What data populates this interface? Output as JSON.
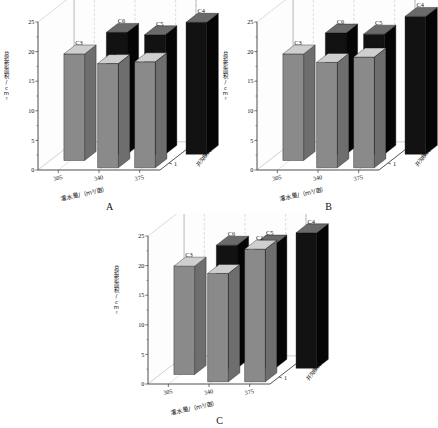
{
  "figure": {
    "background": "#ffffff",
    "panels": [
      "A",
      "B",
      "C"
    ]
  },
  "axis": {
    "ylabel": "总投影面积/cm²",
    "xlabel": "灌水量/（m³/亩）",
    "zlabel": "开沟模式",
    "yticks": [
      "0",
      "5",
      "10",
      "15",
      "20",
      "25"
    ],
    "xticks": [
      "305",
      "340",
      "375"
    ],
    "zticks": [
      "1",
      "2"
    ],
    "ylim": [
      0,
      25
    ]
  },
  "colors": {
    "bar_gray": "#8a8a8a",
    "bar_gray_side": "#6e6e6e",
    "bar_gray_top": "#cfcfcf",
    "bar_black": "#121212",
    "bar_black_side": "#050505",
    "bar_black_top": "#6a6a6a",
    "wall": "#fdfdfd",
    "floor": "#ffffff",
    "grid": "#b9b9b9",
    "axis_line": "#3a3a3a"
  },
  "chart_data": [
    {
      "type": "bar",
      "title": "A",
      "xlabel": "灌水量/（m³/亩）",
      "ylabel": "总投影面积/cm²",
      "zlabel": "开沟模式",
      "categories": [
        "305",
        "340",
        "375"
      ],
      "z_categories": [
        "1",
        "2"
      ],
      "ylim": [
        0,
        25
      ],
      "grid": true,
      "legend": "none",
      "bars": [
        {
          "label": "C3",
          "x": "305",
          "z": "1",
          "value": 18.0,
          "color": "gray"
        },
        {
          "label": "C6",
          "x": "340",
          "z": "1",
          "value": 20.6,
          "color": "black"
        },
        {
          "label": "C2",
          "x": "340",
          "z": "2",
          "value": 17.6,
          "color": "gray"
        },
        {
          "label": "C5",
          "x": "375",
          "z": "1",
          "value": 20.2,
          "color": "black"
        },
        {
          "label": "C1",
          "x": "375",
          "z": "2",
          "value": 17.9,
          "color": "gray"
        },
        {
          "label": "C4",
          "x": "375",
          "z": "1b",
          "value": 22.3,
          "color": "black"
        }
      ]
    },
    {
      "type": "bar",
      "title": "B",
      "xlabel": "灌水量/（m³/亩）",
      "ylabel": "总投影面积/cm²",
      "zlabel": "开沟模式",
      "categories": [
        "305",
        "340",
        "375"
      ],
      "z_categories": [
        "1",
        "2"
      ],
      "ylim": [
        0,
        25
      ],
      "grid": true,
      "legend": "none",
      "bars": [
        {
          "label": "C3",
          "x": "305",
          "z": "1",
          "value": 18.0,
          "color": "gray"
        },
        {
          "label": "C6",
          "x": "340",
          "z": "1",
          "value": 20.5,
          "color": "black"
        },
        {
          "label": "C2",
          "x": "340",
          "z": "2",
          "value": 17.8,
          "color": "gray"
        },
        {
          "label": "C5",
          "x": "375",
          "z": "1",
          "value": 20.3,
          "color": "black"
        },
        {
          "label": "C1",
          "x": "375",
          "z": "2",
          "value": 18.7,
          "color": "gray"
        },
        {
          "label": "C4",
          "x": "375",
          "z": "1b",
          "value": 23.3,
          "color": "black"
        }
      ]
    },
    {
      "type": "bar",
      "title": "C",
      "xlabel": "灌水量/（m³/亩）",
      "ylabel": "总投影面积/cm²",
      "zlabel": "开沟模式",
      "categories": [
        "305",
        "340",
        "375"
      ],
      "z_categories": [
        "1",
        "2"
      ],
      "ylim": [
        0,
        25
      ],
      "grid": true,
      "legend": "none",
      "bars": [
        {
          "label": "C3",
          "x": "305",
          "z": "1",
          "value": 18.3,
          "color": "gray"
        },
        {
          "label": "C6",
          "x": "340",
          "z": "1",
          "value": 20.8,
          "color": "black"
        },
        {
          "label": "C2",
          "x": "340",
          "z": "2",
          "value": 18.3,
          "color": "gray"
        },
        {
          "label": "C5",
          "x": "375",
          "z": "1",
          "value": 21.0,
          "color": "black"
        },
        {
          "label": "C1",
          "x": "375",
          "z": "2",
          "value": 22.4,
          "color": "gray"
        },
        {
          "label": "C4",
          "x": "375",
          "z": "1b",
          "value": 22.9,
          "color": "black"
        }
      ]
    }
  ]
}
